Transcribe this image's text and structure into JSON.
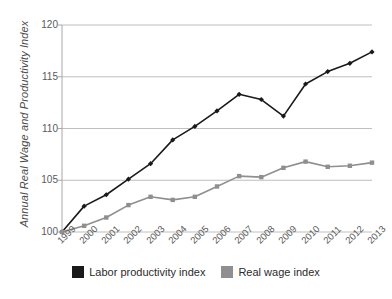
{
  "chart_data": {
    "type": "line",
    "title": "",
    "xlabel": "",
    "ylabel": "Annual Real Wage and Productivity Index",
    "categories": [
      "1999",
      "2000",
      "2001",
      "2002",
      "2003",
      "2004",
      "2005",
      "2006",
      "2007",
      "2008",
      "2009",
      "2010",
      "2011",
      "2012",
      "2013"
    ],
    "ylim": [
      100,
      120
    ],
    "yticks": [
      100,
      105,
      110,
      115,
      120
    ],
    "ytick_labels": [
      "100",
      "105",
      "110",
      "115",
      "120"
    ],
    "grid": true,
    "legend_position": "bottom",
    "series": [
      {
        "name": "Labor productivity index",
        "color": "#1a1a1a",
        "marker": "diamond",
        "values": [
          100.0,
          102.5,
          103.6,
          105.1,
          106.6,
          108.9,
          110.2,
          111.7,
          113.3,
          112.8,
          111.2,
          114.3,
          115.5,
          116.3,
          117.4
        ]
      },
      {
        "name": "Real wage index",
        "color": "#8f8f8f",
        "marker": "square",
        "values": [
          100.0,
          100.6,
          101.4,
          102.6,
          103.4,
          103.1,
          103.4,
          104.4,
          105.4,
          105.3,
          106.2,
          106.8,
          106.3,
          106.4,
          106.7
        ]
      }
    ]
  },
  "legend": {
    "entries": [
      {
        "label": "Labor productivity index",
        "color": "#1a1a1a"
      },
      {
        "label": "Real wage index",
        "color": "#8f8f8f"
      }
    ]
  },
  "axes": {
    "y_title": "Annual Real Wage and Productivity Index"
  },
  "colors": {
    "productivity": "#1a1a1a",
    "real_wage": "#8f8f8f",
    "grid": "#bfbfbf",
    "axis": "#a8a8a8",
    "text": "#5a5a5a"
  }
}
